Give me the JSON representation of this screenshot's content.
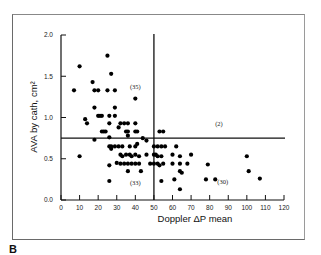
{
  "panel_label": "B",
  "chart_data": {
    "type": "scatter",
    "title": "",
    "xlabel": "Doppler ΔP mean",
    "ylabel": "AVA by cath, cm²",
    "xlim": [
      0,
      120
    ],
    "ylim": [
      0.0,
      2.0
    ],
    "xticks": [
      0,
      10,
      20,
      30,
      40,
      50,
      60,
      70,
      80,
      90,
      100,
      110,
      120
    ],
    "yticks": [
      "0.0",
      "0.5",
      "1.0",
      "1.5",
      "2.0"
    ],
    "grid": false,
    "reference_lines": {
      "vertical_x": 50,
      "horizontal_y": 0.75
    },
    "quadrant_annotations": [
      {
        "label": "(35)",
        "x": 40,
        "y": 1.35
      },
      {
        "label": "(2)",
        "x": 85,
        "y": 0.9
      },
      {
        "label": "(33)",
        "x": 40,
        "y": 0.18
      },
      {
        "label": "(30)",
        "x": 87,
        "y": 0.2
      }
    ],
    "series": [
      {
        "name": "patients",
        "points": [
          [
            7,
            1.33
          ],
          [
            10,
            1.62
          ],
          [
            14,
            0.93
          ],
          [
            17,
            1.43
          ],
          [
            18,
            1.33
          ],
          [
            20,
            1.33
          ],
          [
            25,
            1.75
          ],
          [
            27,
            1.53
          ],
          [
            25,
            1.33
          ],
          [
            29,
            1.33
          ],
          [
            40,
            1.23
          ],
          [
            18,
            1.12
          ],
          [
            20,
            1.02
          ],
          [
            21,
            1.02
          ],
          [
            22,
            1.02
          ],
          [
            26,
            1.02
          ],
          [
            29,
            1.02
          ],
          [
            29,
            1.12
          ],
          [
            26,
            0.93
          ],
          [
            32,
            0.93
          ],
          [
            34,
            0.93
          ],
          [
            36,
            0.93
          ],
          [
            40,
            0.93
          ],
          [
            22,
            0.83
          ],
          [
            23,
            0.83
          ],
          [
            24,
            0.83
          ],
          [
            35,
            0.83
          ],
          [
            36,
            0.83
          ],
          [
            40,
            0.83
          ],
          [
            41,
            0.83
          ],
          [
            44,
            0.75
          ],
          [
            36,
            0.78
          ],
          [
            13,
            0.98
          ],
          [
            31,
            0.88
          ],
          [
            26,
            0.76
          ],
          [
            53,
            0.83
          ],
          [
            55,
            0.83
          ],
          [
            10,
            0.53
          ],
          [
            18,
            0.73
          ],
          [
            26,
            0.65
          ],
          [
            27,
            0.65
          ],
          [
            27,
            0.62
          ],
          [
            29,
            0.65
          ],
          [
            31,
            0.65
          ],
          [
            33,
            0.65
          ],
          [
            37,
            0.65
          ],
          [
            40,
            0.65
          ],
          [
            41,
            0.68
          ],
          [
            46,
            0.72
          ],
          [
            32,
            0.55
          ],
          [
            33,
            0.53
          ],
          [
            35,
            0.55
          ],
          [
            37,
            0.55
          ],
          [
            38,
            0.53
          ],
          [
            40,
            0.55
          ],
          [
            42,
            0.53
          ],
          [
            46,
            0.55
          ],
          [
            26,
            0.42
          ],
          [
            30,
            0.45
          ],
          [
            32,
            0.44
          ],
          [
            34,
            0.44
          ],
          [
            36,
            0.44
          ],
          [
            38,
            0.44
          ],
          [
            40,
            0.44
          ],
          [
            42,
            0.44
          ],
          [
            36,
            0.35
          ],
          [
            43,
            0.35
          ],
          [
            26,
            0.23
          ],
          [
            50,
            0.65
          ],
          [
            52,
            0.65
          ],
          [
            54,
            0.65
          ],
          [
            56,
            0.65
          ],
          [
            62,
            0.65
          ],
          [
            50,
            0.55
          ],
          [
            51,
            0.55
          ],
          [
            52,
            0.53
          ],
          [
            54,
            0.53
          ],
          [
            60,
            0.55
          ],
          [
            64,
            0.53
          ],
          [
            70,
            0.55
          ],
          [
            100,
            0.53
          ],
          [
            48,
            0.44
          ],
          [
            50,
            0.44
          ],
          [
            52,
            0.44
          ],
          [
            53,
            0.42
          ],
          [
            55,
            0.44
          ],
          [
            60,
            0.44
          ],
          [
            64,
            0.44
          ],
          [
            68,
            0.44
          ],
          [
            79,
            0.43
          ],
          [
            64,
            0.35
          ],
          [
            65,
            0.33
          ],
          [
            101,
            0.35
          ],
          [
            54,
            0.23
          ],
          [
            61,
            0.25
          ],
          [
            78,
            0.25
          ],
          [
            83,
            0.25
          ],
          [
            107,
            0.26
          ],
          [
            64,
            0.13
          ]
        ]
      }
    ]
  }
}
